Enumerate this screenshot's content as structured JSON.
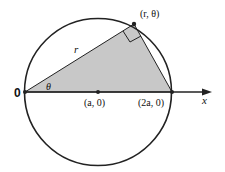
{
  "diagram": {
    "type": "polar-circle",
    "colors": {
      "stroke": "#222222",
      "fill": "#c8c8c8",
      "background": "#ffffff"
    },
    "labels": {
      "origin": "0",
      "center": "(a, 0)",
      "diameter_end": "(2a, 0)",
      "point": "(r, θ)",
      "radius": "r",
      "angle": "θ",
      "axis": "x"
    }
  }
}
